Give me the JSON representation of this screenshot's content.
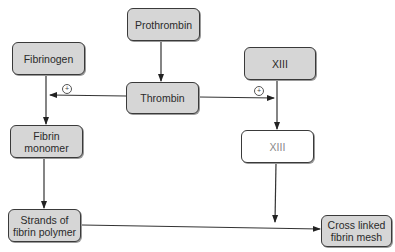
{
  "diagram": {
    "nodes": [
      {
        "id": "prothrombin",
        "label": "Prothrombin"
      },
      {
        "id": "fibrinogen",
        "label": "Fibrinogen"
      },
      {
        "id": "thrombin",
        "label": "Thrombin"
      },
      {
        "id": "xiii",
        "label": "XIII"
      },
      {
        "id": "fibrin_monomer",
        "label": "Fibrin\nmonomer"
      },
      {
        "id": "xiii_active",
        "label": "XIII"
      },
      {
        "id": "strands",
        "label": "Strands of\nfibrin polymer"
      },
      {
        "id": "cross_linked",
        "label": "Cross linked\nfibrin mesh"
      }
    ],
    "edges": [
      {
        "from": "prothrombin",
        "to": "thrombin"
      },
      {
        "from": "fibrinogen",
        "to": "fibrin_monomer"
      },
      {
        "from": "thrombin",
        "to": "fibrinogen-fibrin_monomer edge",
        "label": "+"
      },
      {
        "from": "thrombin",
        "to": "xiii-xiii_active edge",
        "label": "+"
      },
      {
        "from": "xiii",
        "to": "xiii_active"
      },
      {
        "from": "fibrin_monomer",
        "to": "strands"
      },
      {
        "from": "xiii_active",
        "to": "strands-cross_linked edge"
      },
      {
        "from": "strands",
        "to": "cross_linked"
      }
    ],
    "activation_symbol": "+"
  }
}
